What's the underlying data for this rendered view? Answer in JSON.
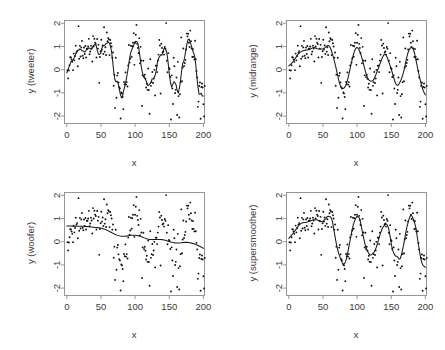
{
  "figure": {
    "layout": "2x2-grid",
    "background": "#ffffff",
    "point_color": "#101010",
    "curve_color": "#1a1a1a",
    "frame_color": "#8c8c8c"
  },
  "panels": [
    {
      "id": "tweeter",
      "ylabel": "y (tweeter)",
      "xlabel": "x",
      "position": "top-left"
    },
    {
      "id": "midrange",
      "ylabel": "y (midrange)",
      "xlabel": "x",
      "position": "top-right"
    },
    {
      "id": "woofer",
      "ylabel": "y (woofer)",
      "xlabel": "x",
      "position": "bottom-left"
    },
    {
      "id": "supersmoother",
      "ylabel": "y (supersmoother)",
      "xlabel": "x",
      "position": "bottom-right"
    }
  ],
  "chart_data": [
    {
      "type": "scatter",
      "title": "",
      "xlabel": "x",
      "ylabel": "y (tweeter)",
      "xlim": [
        0,
        205
      ],
      "ylim": [
        -2.2,
        2.1
      ],
      "xticks": [
        0,
        50,
        100,
        150,
        200
      ],
      "yticks": [
        -2,
        -1,
        0,
        1,
        2
      ],
      "grid": false,
      "legend": "none",
      "series": [
        {
          "name": "observations",
          "marker": "point",
          "x": [
            2,
            4,
            5,
            7,
            8,
            10,
            11,
            13,
            14,
            16,
            17,
            19,
            20,
            22,
            23,
            25,
            26,
            28,
            29,
            31,
            32,
            34,
            35,
            37,
            38,
            40,
            41,
            43,
            44,
            46,
            47,
            49,
            50,
            52,
            53,
            55,
            56,
            58,
            59,
            61,
            62,
            64,
            65,
            67,
            68,
            70,
            71,
            73,
            74,
            76,
            77,
            79,
            80,
            82,
            83,
            85,
            86,
            88,
            89,
            91,
            92,
            94,
            95,
            97,
            98,
            100,
            101,
            103,
            104,
            106,
            107,
            109,
            110,
            112,
            113,
            115,
            116,
            118,
            119,
            121,
            122,
            124,
            125,
            127,
            128,
            130,
            131,
            133,
            134,
            136,
            137,
            139,
            140,
            142,
            143,
            145,
            146,
            148,
            149,
            151,
            152,
            154,
            155,
            157,
            158,
            160,
            161,
            163,
            164,
            166,
            167,
            169,
            170,
            172,
            173,
            175,
            176,
            178,
            179,
            181,
            182,
            184,
            185,
            187,
            188,
            190,
            191,
            193,
            194,
            196,
            197,
            199,
            200,
            202
          ],
          "y": [
            0.15,
            -0.05,
            0.45,
            0.35,
            -0.55,
            0.6,
            0.1,
            -0.6,
            0.55,
            -0.7,
            0.7,
            0.3,
            -0.5,
            0.75,
            0.6,
            0.9,
            1.05,
            -0.45,
            0.85,
            1.15,
            0.65,
            1.3,
            0.75,
            1.0,
            1.6,
            0.9,
            1.2,
            1.9,
            1.0,
            0.95,
            1.3,
            1.1,
            0.85,
            1.15,
            1.45,
            0.95,
            1.0,
            0.8,
            1.1,
            0.7,
            0.95,
            0.6,
            0.85,
            0.3,
            0.55,
            0.1,
            0.35,
            -0.1,
            0.15,
            -0.4,
            -0.25,
            -0.7,
            -0.35,
            -0.95,
            -0.5,
            -1.15,
            -0.75,
            -1.3,
            -2.1,
            -0.95,
            -1.55,
            -0.45,
            -1.2,
            -0.6,
            -0.2,
            -0.75,
            0.1,
            -0.35,
            0.35,
            0.1,
            0.6,
            0.45,
            0.95,
            0.7,
            1.25,
            1.0,
            1.75,
            1.2,
            0.85,
            1.0,
            0.65,
            0.55,
            0.3,
            0.1,
            -0.25,
            -0.5,
            -1.3,
            -0.75,
            -1.15,
            -2.05,
            -0.95,
            -1.35,
            -0.6,
            -0.4,
            -1.1,
            0.1,
            -0.2,
            0.55,
            0.35,
            1.9,
            0.8,
            1.1,
            0.9,
            0.6,
            0.75,
            0.45,
            0.2,
            -0.1,
            -0.35,
            -0.6,
            -2.0,
            -0.95,
            -1.25,
            -0.7,
            -0.45,
            -0.15,
            0.25,
            0.6,
            1.0,
            1.35,
            1.9,
            1.15,
            0.9,
            1.05,
            0.7,
            0.4,
            0.15,
            -0.15,
            -0.45,
            -0.7,
            -1.6,
            -0.95,
            -0.55,
            -0.8
          ]
        },
        {
          "name": "smooth-fit",
          "type": "line",
          "comment": "tweeter span: very small, tracks local oscillations tightly"
        }
      ]
    },
    {
      "type": "scatter",
      "title": "",
      "xlabel": "x",
      "ylabel": "y (midrange)",
      "xlim": [
        0,
        205
      ],
      "ylim": [
        -2.2,
        2.1
      ],
      "xticks": [
        0,
        50,
        100,
        150,
        200
      ],
      "yticks": [
        -2,
        -1,
        0,
        1,
        2
      ],
      "grid": false,
      "legend": "none",
      "series": [
        {
          "name": "observations",
          "marker": "point",
          "comment": "same data as tweeter panel"
        },
        {
          "name": "smooth-fit",
          "type": "line",
          "comment": "midrange span: medium, damped wiggle, flattens after x=80"
        }
      ]
    },
    {
      "type": "scatter",
      "title": "",
      "xlabel": "x",
      "ylabel": "y (woofer)",
      "xlim": [
        0,
        205
      ],
      "ylim": [
        -2.2,
        2.1
      ],
      "xticks": [
        0,
        50,
        100,
        150,
        200
      ],
      "yticks": [
        -2,
        -1,
        0,
        1,
        2
      ],
      "grid": false,
      "legend": "none",
      "series": [
        {
          "name": "observations",
          "marker": "point",
          "comment": "same data as tweeter panel"
        },
        {
          "name": "smooth-fit",
          "type": "line",
          "comment": "woofer span: large, nearly linear decline from 0.7 to -0.35"
        }
      ]
    },
    {
      "type": "scatter",
      "title": "",
      "xlabel": "x",
      "ylabel": "y (supersmoother)",
      "xlim": [
        0,
        205
      ],
      "ylim": [
        -2.2,
        2.1
      ],
      "xticks": [
        0,
        50,
        100,
        150,
        200
      ],
      "yticks": [
        -2,
        -1,
        0,
        1,
        2
      ],
      "grid": false,
      "legend": "none",
      "series": [
        {
          "name": "observations",
          "marker": "point",
          "comment": "same data as tweeter panel"
        },
        {
          "name": "smooth-fit",
          "type": "line",
          "comment": "supersmoother: adaptive span, smooth rise then clean oscillations"
        }
      ]
    }
  ]
}
